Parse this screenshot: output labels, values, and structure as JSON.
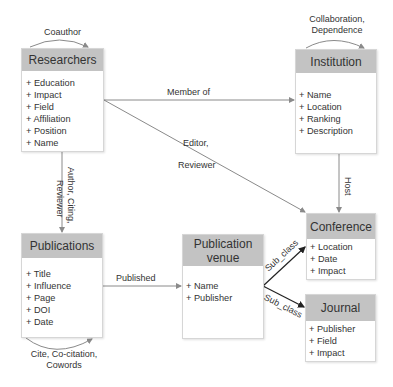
{
  "entities": {
    "researchers": {
      "title": "Researchers",
      "attributes": [
        "+ Education",
        "+ Impact",
        "+ Field",
        "+ Affiliation",
        "+ Position",
        "+ Name"
      ]
    },
    "institution": {
      "title": "Institution",
      "attributes": [
        "+ Name",
        "+ Location",
        "+ Ranking",
        "+ Description"
      ]
    },
    "publications": {
      "title": "Publications",
      "attributes": [
        "+ Title",
        "+ Influence",
        "+ Page",
        "+ DOI",
        "+ Date"
      ]
    },
    "publication_venue": {
      "title_line1": "Publication",
      "title_line2": "venue",
      "attributes": [
        "+ Name",
        "+ Publisher"
      ]
    },
    "conference": {
      "title": "Conference",
      "attributes": [
        "+ Location",
        "+ Date",
        "+ Impact"
      ]
    },
    "journal": {
      "title": "Journal",
      "attributes": [
        "+ Publisher",
        "+ Field",
        "+ Impact"
      ]
    }
  },
  "relations": {
    "coauthor": "Coauthor",
    "collaboration_line1": "Collaboration,",
    "collaboration_line2": "Dependence",
    "member_of": "Member of",
    "editor_line1": "Editor,",
    "editor_line2": "Reviewer",
    "author_line1": "Author, Citing,",
    "author_line2": "Reviewer",
    "host": "Host",
    "published": "Published",
    "subclass_conference": "Sub_class",
    "subclass_journal": "Sub_class",
    "cite_line1": "Cite, Co-citation,",
    "cite_line2": "Cowords"
  },
  "colors": {
    "header": "#c3c3c3",
    "line": "#8a8a8a",
    "subclass": "#222222"
  }
}
